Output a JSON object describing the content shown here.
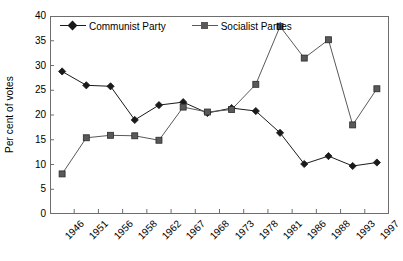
{
  "chart_data": {
    "type": "line",
    "title": "",
    "xlabel": "",
    "ylabel": "Per cent of votes",
    "ylim": [
      0,
      40
    ],
    "ytick_step": 5,
    "yticks": [
      0,
      5,
      10,
      15,
      20,
      25,
      30,
      35,
      40
    ],
    "grid": false,
    "legend_position": "top-left-inside",
    "categories": [
      "1946",
      "1951",
      "1956",
      "1958",
      "1962",
      "1967",
      "1968",
      "1973",
      "1978",
      "1981",
      "1986",
      "1988",
      "1993",
      "1997"
    ],
    "series": [
      {
        "name": "Communist Party",
        "marker": "diamond",
        "color": "#1a1a1a",
        "values": [
          28.8,
          26.0,
          25.8,
          19.0,
          22.0,
          22.6,
          20.4,
          21.4,
          20.8,
          16.4,
          10.1,
          11.7,
          9.7,
          10.4
        ]
      },
      {
        "name": "Socialist Parties",
        "marker": "square",
        "color": "#595959",
        "values": [
          8.1,
          15.4,
          15.9,
          15.8,
          14.9,
          21.6,
          20.6,
          21.1,
          26.2,
          37.9,
          31.5,
          35.2,
          18.0,
          25.3
        ]
      }
    ]
  },
  "axis": {
    "y_title": "Per cent of votes"
  },
  "legend": {
    "items": [
      {
        "label": "Communist Party"
      },
      {
        "label": "Socialist Parties"
      }
    ]
  },
  "colors": {
    "communist": "#1a1a1a",
    "socialist": "#595959",
    "frame": "#6e6e6e",
    "background": "#ffffff"
  }
}
